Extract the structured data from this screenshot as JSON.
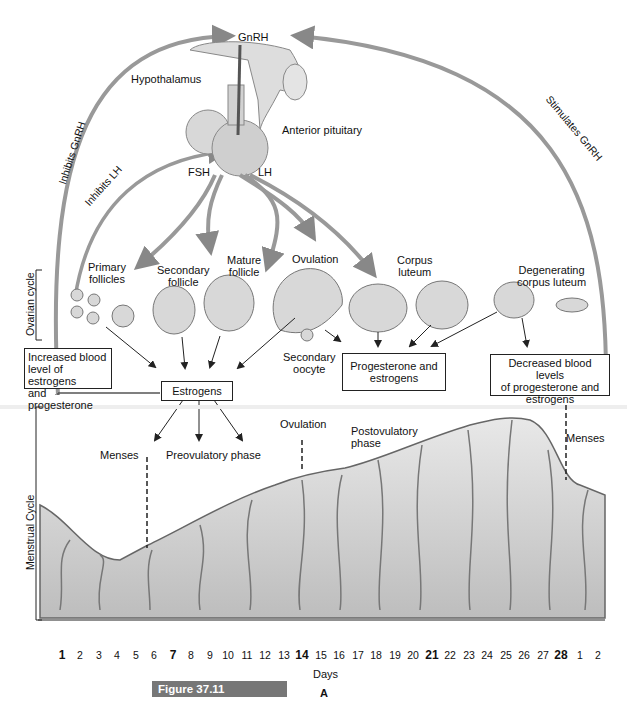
{
  "hormones": {
    "gnrh": "GnRH",
    "fsh": "FSH",
    "lh": "LH"
  },
  "structures": {
    "hypothalamus": "Hypothalamus",
    "anterior_pituitary": "Anterior pituitary"
  },
  "feedback": {
    "inhibits_gnrh": "Inhibits GnRH",
    "inhibits_lh": "Inhibits LH",
    "stimulates_gnrh": "Stimulates GnRH"
  },
  "side_labels": {
    "ovarian": "Ovarian cycle",
    "menstrual": "Menstrual Cycle"
  },
  "ovarian_stages": [
    {
      "line1": "Primary",
      "line2": "follicles"
    },
    {
      "line1": "Secondary",
      "line2": "follicle"
    },
    {
      "line1": "Mature",
      "line2": "follicle"
    },
    {
      "line1": "Ovulation",
      "line2": ""
    },
    {
      "line1": "Corpus",
      "line2": "luteum"
    },
    {
      "line1": "Degenerating",
      "line2": "corpus luteum"
    }
  ],
  "secondary_oocyte": {
    "line1": "Secondary",
    "line2": "oocyte"
  },
  "boxes": {
    "increased": [
      "Increased blood",
      "level of estrogens",
      "and progesterone"
    ],
    "estrogens": "Estrogens",
    "prog_estr": [
      "Progesterone and",
      "estrogens"
    ],
    "decreased": [
      "Decreased blood levels",
      "of progesterone and",
      "estrogens"
    ]
  },
  "phases": {
    "menses_1": "Menses",
    "preovulatory": "Preovulatory phase",
    "ovulation": "Ovulation",
    "postovulatory_1": "Postovulatory",
    "postovulatory_2": "phase",
    "menses_2": "Menses"
  },
  "days": [
    "1",
    "2",
    "3",
    "4",
    "5",
    "6",
    "7",
    "8",
    "9",
    "10",
    "11",
    "12",
    "13",
    "14",
    "15",
    "16",
    "17",
    "18",
    "19",
    "20",
    "21",
    "22",
    "23",
    "24",
    "25",
    "26",
    "27",
    "28",
    "1",
    "2"
  ],
  "bold_days": [
    "1",
    "7",
    "14",
    "21",
    "28"
  ],
  "axis_label": "Days",
  "panel_label": "A",
  "figure_caption": "Figure 37.11"
}
